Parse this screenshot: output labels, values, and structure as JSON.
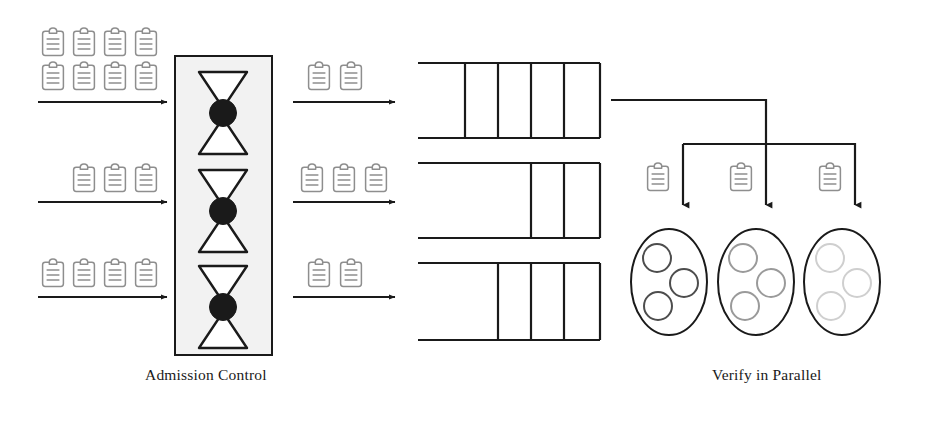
{
  "diagram": {
    "background_color": "#ffffff",
    "line_color": "#262626",
    "icon_color": "#8a8a8a",
    "labels": {
      "admission_control": "Admission Control",
      "verify_in_parallel": "Verify in Parallel"
    },
    "icon_names": {
      "clipboard": "clipboard-icon",
      "hourglass": "hourglass-icon",
      "arrow": "arrow-right-icon",
      "queue": "queue-icon",
      "worker": "worker-ellipse-icon"
    },
    "incoming_lanes": [
      {
        "lane": 1,
        "clipboard_rows": [
          4,
          4
        ],
        "clipboard_count": 8,
        "arrow": "arrow-right-icon"
      },
      {
        "lane": 2,
        "clipboard_rows": [
          3
        ],
        "clipboard_count": 3,
        "arrow": "arrow-right-icon"
      },
      {
        "lane": 3,
        "clipboard_rows": [
          4
        ],
        "clipboard_count": 4,
        "arrow": "arrow-right-icon"
      }
    ],
    "admission_control": {
      "label": "Admission Control",
      "gate_count": 3,
      "gate_shape": "hourglass",
      "box_fill": "#f2f2f2",
      "box_stroke": "#262626"
    },
    "admitted_lanes": [
      {
        "lane": 1,
        "clipboard_count": 2,
        "arrow": "arrow-right-icon"
      },
      {
        "lane": 2,
        "clipboard_count": 3,
        "arrow": "arrow-right-icon"
      },
      {
        "lane": 3,
        "clipboard_count": 2,
        "arrow": "arrow-right-icon"
      }
    ],
    "queues": [
      {
        "lane": 1,
        "slot_count": 4,
        "filled_from": "right"
      },
      {
        "lane": 2,
        "slot_count": 2,
        "filled_from": "right"
      },
      {
        "lane": 3,
        "slot_count": 3,
        "filled_from": "right"
      }
    ],
    "verify_in_parallel": {
      "label": "Verify in Parallel",
      "worker_count": 3,
      "workers": [
        {
          "index": 1,
          "clipboard": "clipboard-icon",
          "arrow": "arrow-down-icon",
          "circle_count": 3,
          "circle_shade": "#4d4d4d"
        },
        {
          "index": 2,
          "clipboard": "clipboard-icon",
          "arrow": "arrow-down-icon",
          "circle_count": 3,
          "circle_shade": "#9a9a9a"
        },
        {
          "index": 3,
          "clipboard": "clipboard-icon",
          "arrow": "arrow-down-icon",
          "circle_count": 3,
          "circle_shade": "#cfcfcf"
        }
      ]
    }
  }
}
